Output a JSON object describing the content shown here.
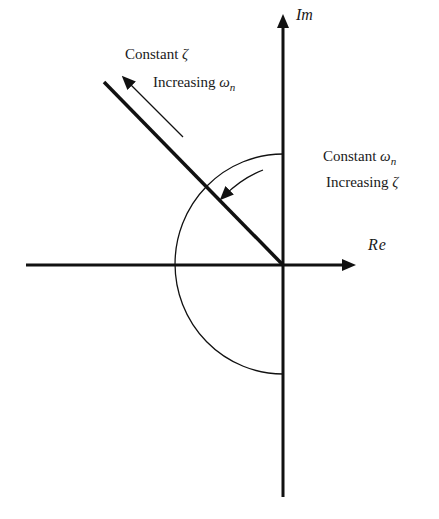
{
  "diagram": {
    "title": "",
    "axes": {
      "real_label": "Re",
      "imag_label": "Im"
    },
    "labels": {
      "constant_zeta": "Constant ",
      "zeta_symbol": "ζ",
      "increasing_wn": "Increasing ",
      "omega_symbol": "ω",
      "n_subscript": "n",
      "constant_wn": "Constant ",
      "increasing_zeta": "Increasing "
    },
    "colors": {
      "ink": "#111111",
      "background": "#ffffff"
    }
  }
}
